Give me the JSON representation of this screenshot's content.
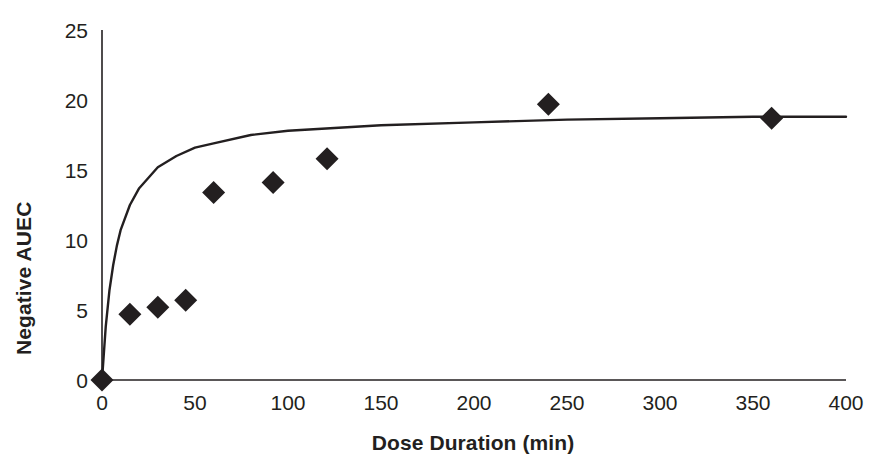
{
  "chart_data": {
    "type": "scatter",
    "title": "",
    "subtitle": "",
    "xlabel": "Dose Duration (min)",
    "ylabel": "Negative AUEC",
    "xlim": [
      0,
      400
    ],
    "ylim": [
      0,
      25
    ],
    "xticks": [
      0,
      50,
      100,
      150,
      200,
      250,
      300,
      350,
      400
    ],
    "xtick_labels": [
      "0",
      "50",
      "100",
      "150",
      "200",
      "250",
      "300",
      "350",
      "400"
    ],
    "yticks": [
      0,
      5,
      10,
      15,
      20,
      25
    ],
    "ytick_labels": [
      "0",
      "5",
      "10",
      "15",
      "20",
      "25"
    ],
    "grid": false,
    "legend": false,
    "legend_position": "none",
    "marker_shape": "diamond",
    "marker_color": "#231f20",
    "line_color": "#231f20",
    "series": [
      {
        "name": "Observed",
        "type": "scatter",
        "points": [
          {
            "x": 0,
            "y": 0
          },
          {
            "x": 15,
            "y": 4.7
          },
          {
            "x": 30,
            "y": 5.2
          },
          {
            "x": 45,
            "y": 5.7
          },
          {
            "x": 60,
            "y": 13.4
          },
          {
            "x": 92,
            "y": 14.1
          },
          {
            "x": 121,
            "y": 15.8
          },
          {
            "x": 240,
            "y": 19.7
          },
          {
            "x": 360,
            "y": 18.7
          }
        ]
      },
      {
        "name": "Fitted curve",
        "type": "line",
        "model": "Emax saturating: y = Emax * x / (x + ED50)",
        "emax": 19.2,
        "ed50": 8.0,
        "points": [
          {
            "x": 0,
            "y": 0
          },
          {
            "x": 2,
            "y": 3.8
          },
          {
            "x": 4,
            "y": 6.4
          },
          {
            "x": 6,
            "y": 8.2
          },
          {
            "x": 8,
            "y": 9.6
          },
          {
            "x": 10,
            "y": 10.7
          },
          {
            "x": 15,
            "y": 12.5
          },
          {
            "x": 20,
            "y": 13.7
          },
          {
            "x": 30,
            "y": 15.2
          },
          {
            "x": 40,
            "y": 16.0
          },
          {
            "x": 50,
            "y": 16.6
          },
          {
            "x": 60,
            "y": 16.9
          },
          {
            "x": 80,
            "y": 17.5
          },
          {
            "x": 100,
            "y": 17.8
          },
          {
            "x": 125,
            "y": 18.0
          },
          {
            "x": 150,
            "y": 18.2
          },
          {
            "x": 200,
            "y": 18.4
          },
          {
            "x": 250,
            "y": 18.6
          },
          {
            "x": 300,
            "y": 18.7
          },
          {
            "x": 350,
            "y": 18.8
          },
          {
            "x": 400,
            "y": 18.8
          }
        ]
      }
    ]
  },
  "axes": {
    "y_title": "Negative AUEC",
    "x_title": "Dose Duration (min)",
    "y_labels": [
      "25",
      "20",
      "15",
      "10",
      "5",
      "0"
    ],
    "x_labels": [
      "0",
      "50",
      "100",
      "150",
      "200",
      "250",
      "300",
      "350",
      "400"
    ]
  },
  "colors": {
    "ink": "#231f20",
    "background": "#ffffff"
  }
}
